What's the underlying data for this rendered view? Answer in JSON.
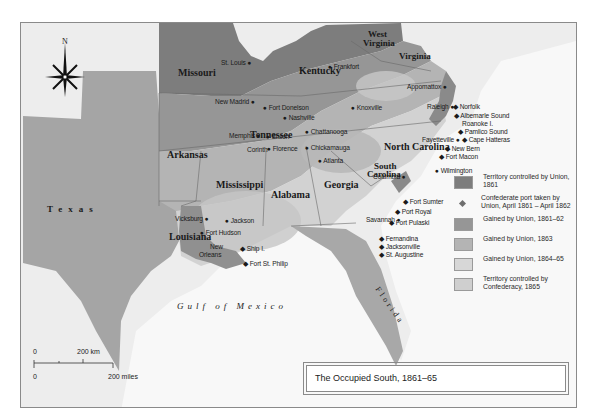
{
  "map": {
    "title": "The Occupied South, 1861–65",
    "compass": {
      "label": "N",
      "icon": "compass-rose-icon"
    },
    "water_labels": {
      "gulf": "Gulf of Mexico"
    },
    "states": {
      "missouri": "Missouri",
      "kentucky": "Kentucky",
      "west_virginia_1": "West",
      "west_virginia_2": "Virginia",
      "virginia": "Virginia",
      "tennessee": "Tennessee",
      "north_carolina": "North Carolina",
      "south_carolina_1": "South",
      "south_carolina_2": "Carolina",
      "arkansas": "Arkansas",
      "mississippi": "Mississippi",
      "alabama": "Alabama",
      "georgia": "Georgia",
      "louisiana": "Louisiana",
      "texas": "Texas",
      "florida": "Florida"
    },
    "cities": {
      "st_louis": "St. Louis",
      "frankfort": "Frankfort",
      "new_madrid": "New Madrid",
      "fort_donelson": "Fort Donelson",
      "nashville": "Nashville",
      "knoxville": "Knoxville",
      "appomattox": "Appomattox",
      "raleigh": "Raleigh",
      "memphis": "Memphis",
      "shiloh": "Shiloh",
      "chattanooga": "Chattanooga",
      "fayetteville": "Fayetteville",
      "corinth": "Corinth",
      "florence": "Florence",
      "chickamauga": "Chickamauga",
      "atlanta": "Atlanta",
      "columbia": "Columbia",
      "wilmington": "Wilmington",
      "vicksburg": "Vicksburg",
      "jackson": "Jackson",
      "savannah": "Savannah",
      "fort_hudson": "Fort Hudson",
      "new_orleans_1": "New",
      "new_orleans_2": "Orleans"
    },
    "ports": {
      "norfolk": "Norfolk",
      "albemarle": "Albemarle Sound",
      "roanoke": "Roanoke I.",
      "pamlico": "Pamlico Sound",
      "hatteras": "Cape Hatteras",
      "new_bern": "New Bern",
      "fort_macon": "Fort Macon",
      "fort_sumter": "Fort Sumter",
      "port_royal": "Port Royal",
      "fort_pulaski": "Fort Pulaski",
      "fernandina": "Fernandina",
      "jacksonville": "Jacksonville",
      "st_augustine": "St. Augustine",
      "ship_island": "Ship I.",
      "fort_st_philip": "Fort St. Philip"
    },
    "scale": {
      "km_zero": "0",
      "km_label": "200 km",
      "mi_zero": "0",
      "mi_label": "200 miles"
    }
  },
  "legend": {
    "items": [
      {
        "label": "Territory controlled by Union, 1861",
        "color": "#7d7d7d",
        "type": "swatch"
      },
      {
        "label": "Confederate port taken by Union, April 1861 – April 1862",
        "color": "#6e6e6e",
        "type": "diamond"
      },
      {
        "label": "Gained by Union, 1861–62",
        "color": "#969696",
        "type": "swatch"
      },
      {
        "label": "Gained by Union, 1863",
        "color": "#b4b4b4",
        "type": "swatch"
      },
      {
        "label": "Gained by Union, 1864–65",
        "color": "#d7d7d7",
        "type": "swatch"
      },
      {
        "label": "Territory controlled by Confederacy, 1865",
        "color": "#cfcfcf",
        "type": "swatch"
      }
    ]
  },
  "colors": {
    "background_land": "#ececec",
    "sea": "#f7f7f7",
    "union_1861": "#7d7d7d",
    "gained_1861_62": "#969696",
    "gained_1863": "#b4b4b4",
    "gained_1864_65": "#d7d7d7",
    "confederacy_1865": "#c4c4c4"
  }
}
